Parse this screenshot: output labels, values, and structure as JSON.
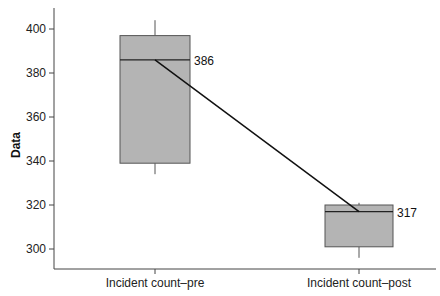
{
  "chart_data": {
    "type": "box",
    "title": "",
    "xlabel": "",
    "ylabel": "Data",
    "ylim": [
      291,
      410
    ],
    "yticks": [
      300,
      320,
      340,
      360,
      380,
      400
    ],
    "grid": false,
    "legend": null,
    "categories": [
      "Incident count–pre",
      "Incident count–post"
    ],
    "boxes": [
      {
        "name": "Incident count–pre",
        "whisker_low": 334,
        "q1": 339,
        "median": 386,
        "q3": 397,
        "whisker_high": 404
      },
      {
        "name": "Incident count–post",
        "whisker_low": 296,
        "q1": 301,
        "median": 317,
        "q3": 320,
        "whisker_high": 321
      }
    ],
    "median_labels": [
      "386",
      "317"
    ],
    "connecting_line": {
      "from": 386,
      "to": 317,
      "description": "line connecting medians"
    }
  },
  "colors": {
    "box_fill": "#b4b4b4",
    "box_stroke": "#555555",
    "median_line": "#222222",
    "connector": "#111111",
    "axis": "#444444"
  }
}
